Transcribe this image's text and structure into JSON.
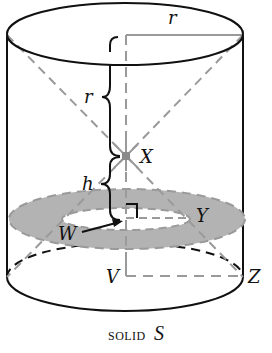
{
  "diagram": {
    "title": "SOLID S",
    "caption_word": "solid",
    "caption_symbol": "S",
    "labels": {
      "top_radius": "r",
      "upper_segment": "r",
      "lower_segment": "h",
      "apex_point": "X",
      "annulus_point": "Y",
      "inner_point": "W",
      "base_center": "V",
      "base_edge": "Z"
    },
    "colors": {
      "outline": "#111111",
      "construction_gray": "#9a9a9a",
      "annulus_fill": "#b3b3b3",
      "background": "#ffffff"
    }
  }
}
